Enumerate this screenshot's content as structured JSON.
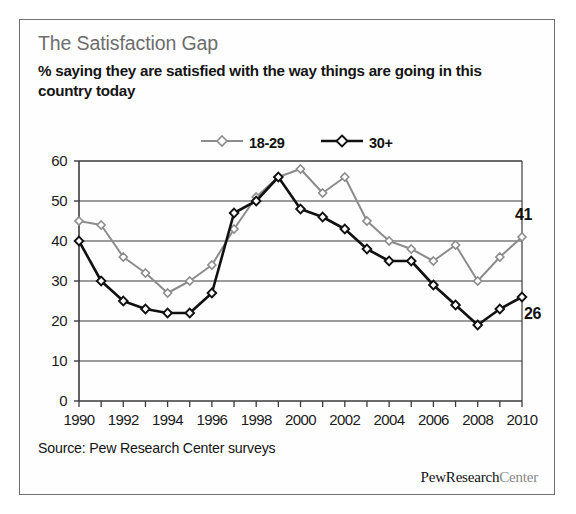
{
  "figure": {
    "title": "The Satisfaction Gap",
    "subtitle": "% saying they are satisfied with the way things are going in this country today",
    "source": "Source: Pew Research Center surveys",
    "brand_dark": "PewResearch",
    "brand_light": "Center",
    "colors": {
      "title": "#6d6d6d",
      "series_young": "#8c8c8c",
      "series_older": "#111111",
      "grid": "#3a3a3a",
      "border": "#6f6f6f",
      "text": "#141414"
    }
  },
  "legend": {
    "entries": [
      {
        "label": "18-29",
        "color": "#8c8c8c",
        "marker": "open-diamond"
      },
      {
        "label": "30+",
        "color": "#111111",
        "marker": "open-diamond"
      }
    ]
  },
  "end_labels": [
    {
      "value": "41",
      "series": "18-29"
    },
    {
      "value": "26",
      "series": "30+"
    }
  ],
  "chart_data": {
    "type": "line",
    "title": "The Satisfaction Gap",
    "subtitle": "% saying they are satisfied with the way things are going in this country today",
    "xlabel": "",
    "ylabel": "",
    "ylim": [
      0,
      60
    ],
    "yticks": [
      0,
      10,
      20,
      30,
      40,
      50,
      60
    ],
    "xlim": [
      1990,
      2010
    ],
    "xticks": [
      1990,
      1991,
      1992,
      1993,
      1994,
      1995,
      1996,
      1997,
      1998,
      1999,
      2000,
      2001,
      2002,
      2003,
      2004,
      2005,
      2006,
      2007,
      2008,
      2009,
      2010
    ],
    "xticklabels": [
      "1990",
      "",
      "1992",
      "",
      "1994",
      "",
      "1996",
      "",
      "1998",
      "",
      "2000",
      "",
      "2002",
      "",
      "2004",
      "",
      "2006",
      "",
      "2008",
      "",
      "2010"
    ],
    "grid": "horizontal",
    "legend_position": "top-center",
    "x": [
      1990,
      1991,
      1992,
      1993,
      1994,
      1995,
      1996,
      1997,
      1998,
      1999,
      2000,
      2001,
      2002,
      2003,
      2004,
      2005,
      2006,
      2007,
      2008,
      2009,
      2010
    ],
    "series": [
      {
        "name": "18-29",
        "color": "#8c8c8c",
        "marker": "open-diamond",
        "values": [
          45,
          44,
          36,
          32,
          27,
          30,
          34,
          43,
          51,
          56,
          58,
          52,
          56,
          45,
          40,
          38,
          35,
          39,
          30,
          36,
          41
        ],
        "end_label": "41"
      },
      {
        "name": "30+",
        "color": "#111111",
        "marker": "open-diamond",
        "values": [
          40,
          30,
          25,
          23,
          22,
          22,
          27,
          47,
          50,
          56,
          48,
          46,
          43,
          38,
          35,
          35,
          29,
          24,
          19,
          23,
          26
        ],
        "end_label": "26"
      }
    ]
  }
}
